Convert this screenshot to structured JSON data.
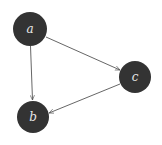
{
  "diagram": {
    "type": "directed-graph",
    "nodes": [
      {
        "id": "a",
        "label": "a",
        "x": 30,
        "y": 29,
        "r": 17
      },
      {
        "id": "b",
        "label": "b",
        "x": 33,
        "y": 117,
        "r": 16
      },
      {
        "id": "c",
        "label": "c",
        "x": 135,
        "y": 77,
        "r": 16
      }
    ],
    "edges": [
      {
        "from": "a",
        "to": "b"
      },
      {
        "from": "a",
        "to": "c"
      },
      {
        "from": "c",
        "to": "b"
      }
    ],
    "colors": {
      "node_fill": "#333333",
      "label": "#e8e8e8",
      "edge": "#555555"
    }
  }
}
